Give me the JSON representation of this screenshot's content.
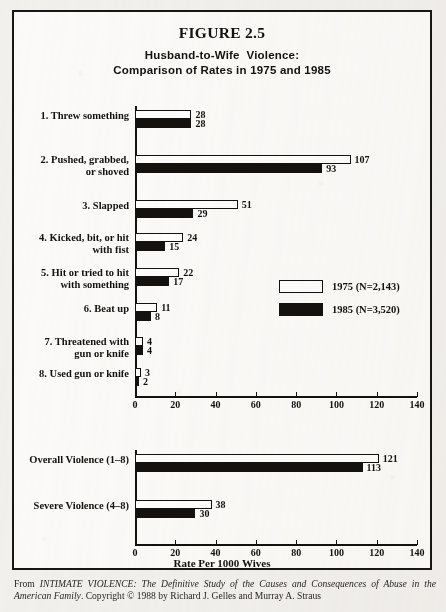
{
  "figure": {
    "number_label": "FIGURE 2.5",
    "subtitle_line1": "Husband-to-Wife  Violence:",
    "subtitle_line2": "Comparison of Rates in 1975 and 1985",
    "axis_title": "Rate Per 1000 Wives"
  },
  "legend": {
    "items": [
      {
        "key": "y1975",
        "label": "1975 (N=2,143)"
      },
      {
        "key": "y1985",
        "label": "1985 (N=3,520)"
      }
    ]
  },
  "citation": {
    "prefix": "From ",
    "work_title": "INTIMATE VIOLENCE: The Definitive Study of the Causes and Consequences of Abuse in the American Family",
    "suffix": ". Copyright © 1988 by Richard J. Gelles and Murray A. Straus"
  },
  "axis": {
    "ticks": [
      "0",
      "20",
      "40",
      "60",
      "80",
      "100",
      "120",
      "140"
    ],
    "min": 0,
    "max": 140,
    "step": 20
  },
  "chart_data": [
    {
      "type": "bar",
      "id": "detailed-violence-rates",
      "orientation": "horizontal",
      "title": "Husband-to-Wife Violence: Comparison of Rates in 1975 and 1985",
      "xlabel": "Rate Per 1000 Wives",
      "ylabel": "",
      "xlim": [
        0,
        140
      ],
      "xticks": [
        0,
        20,
        40,
        60,
        80,
        100,
        120,
        140
      ],
      "grid": false,
      "legend_position": "middle-right",
      "categories": [
        "1. Threw something",
        "2. Pushed, grabbed,\n    or shoved",
        "3. Slapped",
        "4. Kicked, bit, or hit\n    with fist",
        "5. Hit or tried to hit\n    with something",
        "6. Beat up",
        "7. Threatened with\n    gun or knife",
        "8. Used gun or knife"
      ],
      "series": [
        {
          "name": "1975 (N=2,143)",
          "values": [
            28,
            107,
            51,
            24,
            22,
            11,
            4,
            3
          ]
        },
        {
          "name": "1985 (N=3,520)",
          "values": [
            28,
            93,
            29,
            15,
            17,
            8,
            4,
            2
          ]
        }
      ]
    },
    {
      "type": "bar",
      "id": "summary-violence-rates",
      "orientation": "horizontal",
      "title": "",
      "xlabel": "Rate Per 1000 Wives",
      "ylabel": "",
      "xlim": [
        0,
        140
      ],
      "xticks": [
        0,
        20,
        40,
        60,
        80,
        100,
        120,
        140
      ],
      "grid": false,
      "legend_position": "none",
      "categories": [
        "Overall Violence (1–8)",
        "Severe Violence (4–8)"
      ],
      "series": [
        {
          "name": "1975 (N=2,143)",
          "values": [
            121,
            38
          ]
        },
        {
          "name": "1985 (N=3,520)",
          "values": [
            113,
            30
          ]
        }
      ]
    }
  ]
}
